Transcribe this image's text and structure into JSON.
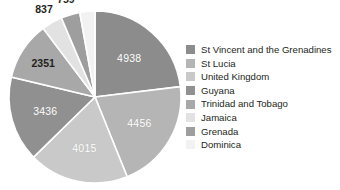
{
  "chart_data": {
    "type": "pie",
    "title": "",
    "subtitle": "",
    "xlabel": "",
    "ylabel": "",
    "grid": false,
    "legend_position": "right",
    "total": 21399,
    "start_angle_deg": 0,
    "direction": "clockwise",
    "categories": [
      "St Vincent and the Grenadines",
      "St Lucia",
      "United Kingdom",
      "Guyana",
      "Trinidad and Tobago",
      "Jamaica",
      "Grenada",
      "Dominica"
    ],
    "values": [
      4938,
      4456,
      4015,
      3436,
      2351,
      837,
      759,
      607
    ],
    "value_labels": [
      "4938",
      "4456",
      "4015",
      "3436",
      "2351",
      "837",
      "759",
      "607"
    ],
    "slice_colors": [
      "#8c8c8c",
      "#b5b5b5",
      "#c9c9c9",
      "#909090",
      "#a8a8a8",
      "#e2e2e2",
      "#9e9e9e",
      "#f2f2f2"
    ],
    "label_placement": [
      "inside",
      "inside",
      "inside",
      "inside",
      "inside",
      "outside",
      "outside",
      "outside"
    ],
    "inside_label_color": "#ffffff",
    "outside_label_color": "#231f20",
    "slices": [
      {
        "name": "St Vincent and the Grenadines",
        "value": 4938,
        "label": "4938",
        "color": "#8c8c8c",
        "placement": "inside"
      },
      {
        "name": "St Lucia",
        "value": 4456,
        "label": "4456",
        "color": "#b5b5b5",
        "placement": "inside"
      },
      {
        "name": "United Kingdom",
        "value": 4015,
        "label": "4015",
        "color": "#c9c9c9",
        "placement": "inside"
      },
      {
        "name": "Guyana",
        "value": 3436,
        "label": "3436",
        "color": "#909090",
        "placement": "inside"
      },
      {
        "name": "Trinidad and Tobago",
        "value": 2351,
        "label": "2351",
        "color": "#a8a8a8",
        "placement": "outside"
      },
      {
        "name": "Jamaica",
        "value": 837,
        "label": "837",
        "color": "#e2e2e2",
        "placement": "outside"
      },
      {
        "name": "Grenada",
        "value": 759,
        "label": "759",
        "color": "#9e9e9e",
        "placement": "outside"
      },
      {
        "name": "Dominica",
        "value": 607,
        "label": "607",
        "color": "#f2f2f2",
        "placement": "outside"
      }
    ]
  },
  "legend": {
    "items": [
      {
        "label": "St Vincent and the Grenadines",
        "color": "#8c8c8c"
      },
      {
        "label": "St Lucia",
        "color": "#b5b5b5"
      },
      {
        "label": "United Kingdom",
        "color": "#c9c9c9"
      },
      {
        "label": "Guyana",
        "color": "#909090"
      },
      {
        "label": "Trinidad and Tobago",
        "color": "#a8a8a8"
      },
      {
        "label": "Jamaica",
        "color": "#e2e2e2"
      },
      {
        "label": "Grenada",
        "color": "#9e9e9e"
      },
      {
        "label": "Dominica",
        "color": "#f2f2f2"
      }
    ]
  }
}
